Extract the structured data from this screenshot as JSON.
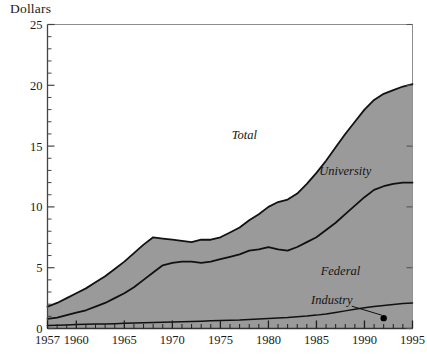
{
  "chart_data": {
    "type": "area",
    "title": "",
    "ylabel": "Dollars",
    "xlabel": "",
    "stacked": true,
    "grid": false,
    "legend_position": "inline-annotations",
    "xlim": [
      1957,
      1995
    ],
    "ylim": [
      0,
      25
    ],
    "ytick_labels": [
      "0",
      "5",
      "10",
      "15",
      "20",
      "25"
    ],
    "ytick_values": [
      0,
      5,
      10,
      15,
      20,
      25
    ],
    "ytick_minor_step": 1,
    "xtick_labels": [
      "1957",
      "1960",
      "1965",
      "1970",
      "1975",
      "1980",
      "1985",
      "1990",
      "1995"
    ],
    "xtick_values": [
      1957,
      1960,
      1965,
      1970,
      1975,
      1980,
      1985,
      1990,
      1995
    ],
    "xtick_minor_step": 1,
    "fill_color": "#9a9a9a",
    "line_color": "#111111",
    "axis_color": "#555555",
    "background_color": "#ffffff",
    "x": [
      1957,
      1958,
      1959,
      1960,
      1961,
      1962,
      1963,
      1964,
      1965,
      1966,
      1967,
      1968,
      1969,
      1970,
      1971,
      1972,
      1973,
      1974,
      1975,
      1976,
      1977,
      1978,
      1979,
      1980,
      1981,
      1982,
      1983,
      1984,
      1985,
      1986,
      1987,
      1988,
      1989,
      1990,
      1991,
      1992,
      1993,
      1994,
      1995
    ],
    "series": [
      {
        "name": "Total",
        "label": "Total",
        "label_x": 1977.5,
        "label_y": 15.6,
        "values": [
          1.8,
          2.1,
          2.5,
          2.9,
          3.3,
          3.8,
          4.3,
          4.9,
          5.5,
          6.2,
          6.9,
          7.5,
          7.4,
          7.3,
          7.2,
          7.1,
          7.3,
          7.3,
          7.5,
          7.9,
          8.3,
          8.9,
          9.4,
          10.0,
          10.4,
          10.6,
          11.1,
          11.9,
          12.8,
          13.8,
          14.9,
          16.0,
          17.0,
          18.0,
          18.8,
          19.3,
          19.6,
          19.9,
          20.1
        ]
      },
      {
        "name": "University",
        "label": "University",
        "label_x": 1988.0,
        "label_y": 12.6,
        "values": [
          0.8,
          0.9,
          1.1,
          1.3,
          1.5,
          1.8,
          2.1,
          2.5,
          2.9,
          3.4,
          4.0,
          4.6,
          5.2,
          5.4,
          5.5,
          5.5,
          5.4,
          5.5,
          5.7,
          5.9,
          6.1,
          6.4,
          6.5,
          6.7,
          6.5,
          6.4,
          6.7,
          7.1,
          7.5,
          8.1,
          8.7,
          9.4,
          10.1,
          10.8,
          11.4,
          11.7,
          11.9,
          12.0,
          12.0
        ]
      },
      {
        "name": "Federal",
        "label": "Federal",
        "label_x": 1987.5,
        "label_y": 4.4,
        "values": [
          0.25,
          0.27,
          0.29,
          0.32,
          0.34,
          0.36,
          0.38,
          0.4,
          0.43,
          0.45,
          0.48,
          0.5,
          0.52,
          0.54,
          0.56,
          0.58,
          0.6,
          0.63,
          0.65,
          0.68,
          0.7,
          0.74,
          0.78,
          0.82,
          0.86,
          0.9,
          0.96,
          1.02,
          1.1,
          1.2,
          1.32,
          1.45,
          1.58,
          1.7,
          1.8,
          1.9,
          1.98,
          2.05,
          2.1
        ]
      }
    ],
    "annotation": {
      "label": "Industry",
      "label_x": 1986.6,
      "label_y": 2.0,
      "point_x": 1992.0,
      "point_y": 0.85
    }
  }
}
